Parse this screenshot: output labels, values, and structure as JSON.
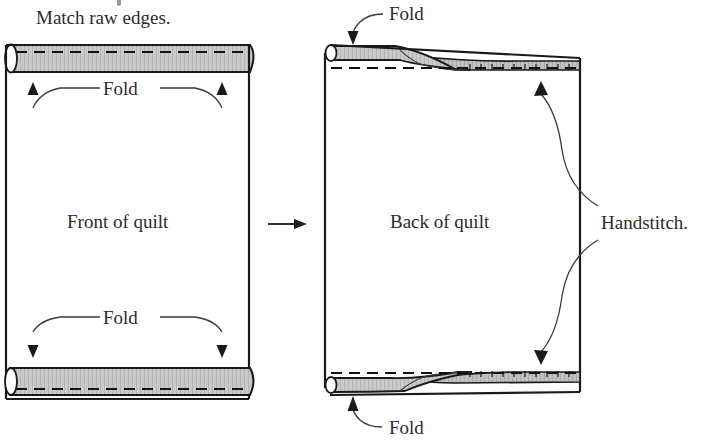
{
  "diagram": {
    "title_note": "Match raw edges.",
    "left_panel": {
      "center_label": "Front of quilt",
      "top_fold_label": "Fold",
      "bottom_fold_label": "Fold"
    },
    "transition": {
      "arrow_icon": "right-arrow-icon"
    },
    "right_panel": {
      "center_label": "Back of quilt",
      "top_fold_label": "Fold",
      "bottom_fold_label": "Fold",
      "handstitch_label": "Handstitch."
    },
    "colors": {
      "binding_gray": "#c9c9c9",
      "binding_gray_dark": "#bdbdbd",
      "outline": "#1a1a1a",
      "leader_line": "#3a3a3a",
      "text": "#2b2b2b",
      "background": "#ffffff"
    }
  }
}
